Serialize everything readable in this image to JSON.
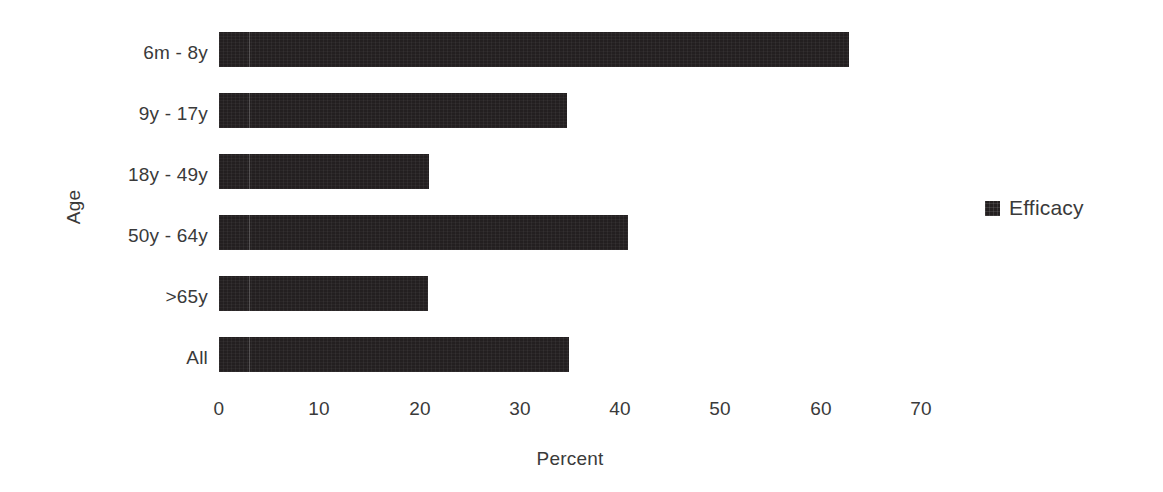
{
  "chart_data": {
    "type": "bar",
    "orientation": "horizontal",
    "title": "",
    "xlabel": "Percent",
    "ylabel": "Age",
    "categories": [
      "6m - 8y",
      "9y - 17y",
      "18y - 49y",
      "50y - 64y",
      ">65y",
      "All"
    ],
    "series": [
      {
        "name": "Efficacy",
        "color": "#231f20",
        "values": [
          62.8,
          34.7,
          20.9,
          40.8,
          20.8,
          34.9
        ]
      }
    ],
    "xlim": [
      0,
      70
    ],
    "xticks": [
      0,
      10,
      20,
      30,
      40,
      50,
      60,
      70
    ],
    "xtick_labels": [
      "0",
      "10",
      "20",
      "30",
      "40",
      "50",
      "60",
      "70"
    ],
    "grid": false,
    "legend_position": "right",
    "legend_entries": [
      "Efficacy"
    ]
  },
  "legend": {
    "swatch_name": "efficacy-swatch",
    "label": "Efficacy"
  },
  "colors": {
    "bar": "#231f20",
    "text": "#3a3a3a",
    "background": "#ffffff"
  }
}
